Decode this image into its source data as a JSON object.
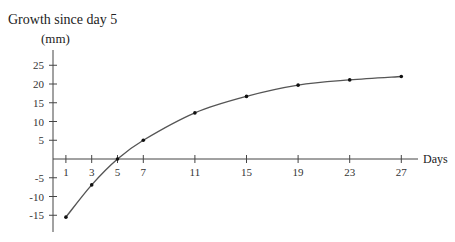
{
  "chart_data": {
    "type": "line",
    "title": "Growth since day 5",
    "ylabel": "(mm)",
    "xlabel": "Days",
    "x": [
      1,
      3,
      5,
      7,
      11,
      15,
      19,
      23,
      27
    ],
    "values": [
      -15.5,
      -6.9,
      0,
      5,
      12.3,
      16.7,
      19.7,
      21.1,
      22.0
    ],
    "xticks": [
      1,
      3,
      5,
      7,
      11,
      15,
      19,
      23,
      27
    ],
    "yticks": [
      25,
      20,
      15,
      10,
      5,
      -5,
      -10,
      -15
    ],
    "xlim": [
      0,
      28
    ],
    "ylim": [
      -19,
      29
    ],
    "grid": false,
    "legend": null,
    "markers": true,
    "line_color": "#555555"
  },
  "labels": {
    "title": "Growth since day 5",
    "unit": "(mm)",
    "x_axis": "Days"
  }
}
